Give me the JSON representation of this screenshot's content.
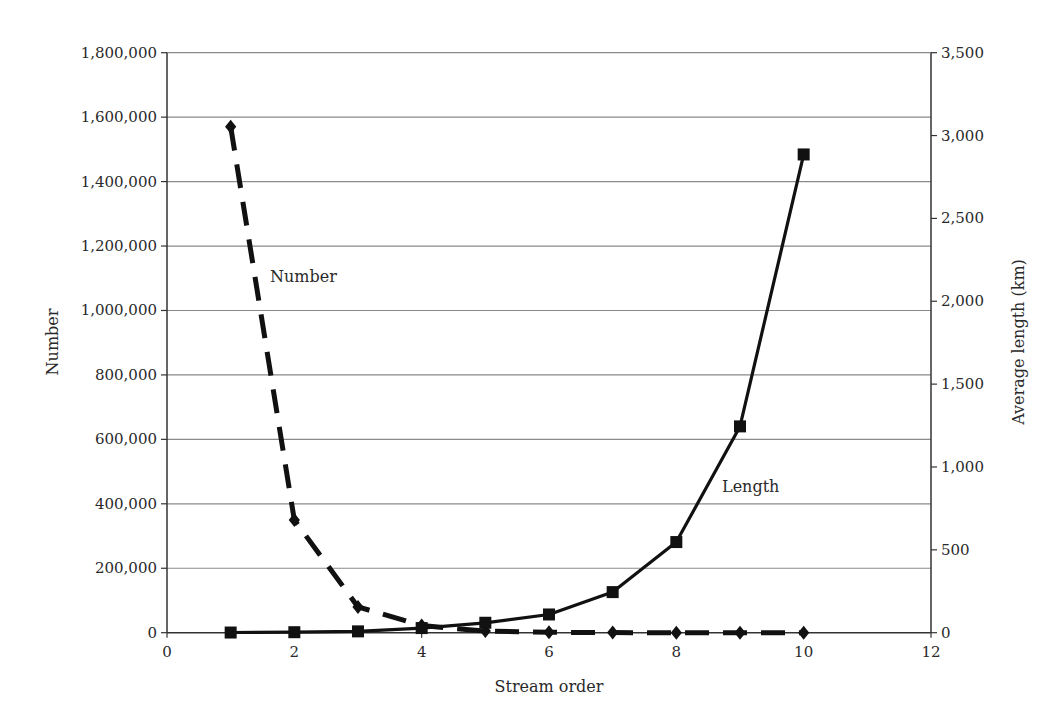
{
  "chart_data": {
    "type": "line",
    "title": "",
    "xlabel": "Stream order",
    "ylabel": "Number",
    "ylabel_right": "Average length (km)",
    "xlim": [
      0,
      12
    ],
    "ylim": [
      0,
      1800000
    ],
    "ylim_right": [
      0,
      3500
    ],
    "x_ticks": [
      0,
      2,
      4,
      6,
      8,
      10,
      12
    ],
    "x_tick_labels": [
      "0",
      "2",
      "4",
      "6",
      "8",
      "10",
      "12"
    ],
    "y_ticks": [
      0,
      200000,
      400000,
      600000,
      800000,
      1000000,
      1200000,
      1400000,
      1600000,
      1800000
    ],
    "y_tick_labels": [
      "0",
      "200,000",
      "400,000",
      "600,000",
      "800,000",
      "1,000,000",
      "1,200,000",
      "1,400,000",
      "1,600,000",
      "1,800,000"
    ],
    "y_right_ticks": [
      0,
      500,
      1000,
      1500,
      2000,
      2500,
      3000,
      3500
    ],
    "y_right_tick_labels": [
      "0",
      "500",
      "1,000",
      "1,500",
      "2,000",
      "2,500",
      "3,000",
      "3,500"
    ],
    "grid": true,
    "legend": "none (inline annotations)",
    "x": [
      1,
      2,
      3,
      4,
      5,
      6,
      7,
      8,
      9,
      10
    ],
    "series": [
      {
        "name": "Number",
        "axis": "left",
        "marker": "diamond",
        "line_style": "dashed",
        "values": [
          1570000,
          350000,
          80000,
          22000,
          5000,
          1300,
          350,
          90,
          20,
          5
        ]
      },
      {
        "name": "Length",
        "axis": "right",
        "marker": "square",
        "line_style": "solid",
        "values": [
          1,
          3,
          8,
          28,
          60,
          110,
          245,
          547,
          1245,
          2886
        ]
      }
    ],
    "annotations": [
      {
        "text": "Number",
        "x": 1.65,
        "y_left": 1100000
      },
      {
        "text": "Length",
        "x": 8.6,
        "y_left": 430000
      }
    ]
  },
  "labels": {
    "x_axis_title": "Stream order",
    "y_axis_title_left": "Number",
    "y_axis_title_right": "Average length (km)",
    "annotation_number": "Number",
    "annotation_length": "Length"
  },
  "colors": {
    "line": "#111111",
    "grid": "#8a8a8a",
    "axis": "#333333",
    "text": "#2a2a2a"
  }
}
